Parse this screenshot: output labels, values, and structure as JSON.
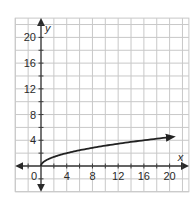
{
  "chart_data": {
    "type": "line",
    "title": "",
    "xlabel": "x",
    "ylabel": "y",
    "xlim": [
      -4,
      23
    ],
    "ylim": [
      -4,
      23
    ],
    "grid": true,
    "grid_step": 2,
    "x_ticks": [
      4,
      8,
      12,
      16,
      20
    ],
    "y_ticks": [
      4,
      8,
      12,
      16,
      20
    ],
    "origin_label": "0",
    "series": [
      {
        "name": "y = sqrt(x)",
        "x": [
          0,
          0.25,
          1,
          2,
          4,
          6,
          8,
          10,
          12,
          14,
          16,
          18,
          20,
          20.5
        ],
        "values": [
          0,
          0.5,
          1,
          1.41,
          2,
          2.45,
          2.83,
          3.16,
          3.46,
          3.74,
          4,
          4.24,
          4.47,
          4.53
        ],
        "end_arrow": true
      }
    ],
    "legend": null
  },
  "labels": {
    "x_axis": "x",
    "y_axis": "y",
    "origin": "0",
    "x_ticks": [
      "4",
      "8",
      "12",
      "16",
      "20"
    ],
    "y_ticks": [
      "4",
      "8",
      "12",
      "16",
      "20"
    ]
  },
  "colors": {
    "grid": "#c8c8c8",
    "axis": "#3a3a3a",
    "curve": "#222222"
  }
}
